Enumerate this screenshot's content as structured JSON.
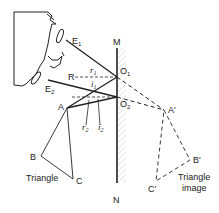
{
  "diagram": {
    "mirror": {
      "top_label": "M",
      "bottom_label": "N"
    },
    "points": {
      "O1": "O1",
      "O2": "O2",
      "A": "A",
      "A_image": "A'",
      "B": "B",
      "C": "C",
      "B_image": "B'",
      "C_image": "C'",
      "R": "R",
      "E1": "E1",
      "E2": "E2"
    },
    "angles": {
      "r1": "r1",
      "i1": "i1",
      "r2": "r2",
      "i2": "i2"
    },
    "captions": {
      "object": "Triangle",
      "image_line1": "Triangle",
      "image_line2": "image"
    },
    "colors": {
      "line": "#222222",
      "hatch": "#cccccc"
    }
  }
}
